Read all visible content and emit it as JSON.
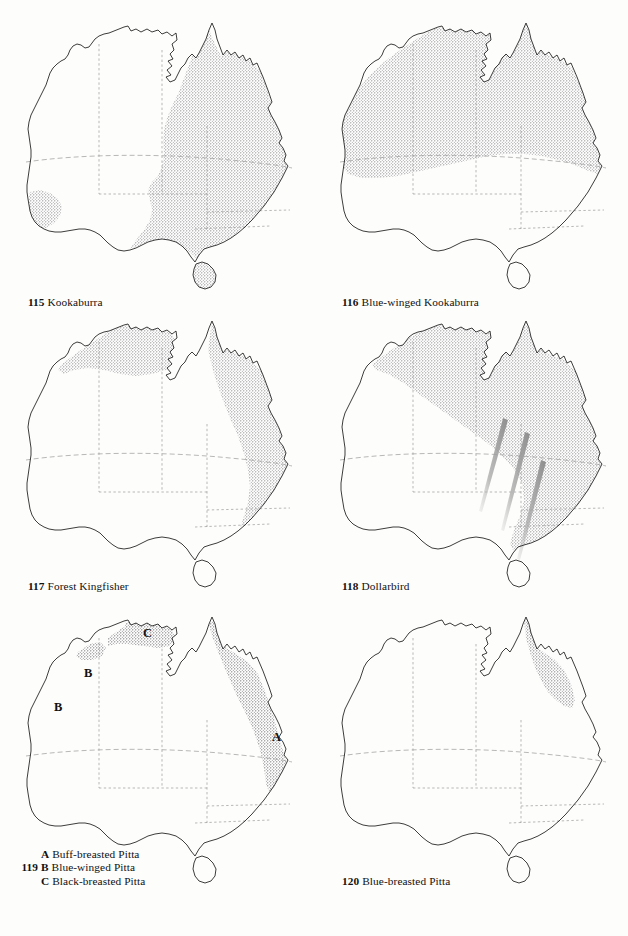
{
  "page": {
    "kind": "field-guide-distribution-map-plate",
    "background_color": "#fdfdfb",
    "ink_color": "#1a1a1a",
    "stipple_color": "#6b6b6b",
    "arrow_color": "#8e8e8e",
    "border_color": "#8a8a8a"
  },
  "maps": [
    {
      "id": "map-115",
      "number": "115",
      "name": "Kookaburra",
      "caption": "115 Kookaburra",
      "region_description": "Eastern Australia from Cape York south through Queensland, New South Wales, Victoria, eastern South Australia and Tasmania; introduced population in south-west Western Australia",
      "markers": []
    },
    {
      "id": "map-116",
      "number": "116",
      "name": "Blue-winged Kookaburra",
      "caption": "116 Blue-winged Kookaburra",
      "region_description": "Northern Australia across the Kimberley, Top End and Gulf country, extending down the Queensland coast to about the mid-east coast",
      "markers": []
    },
    {
      "id": "map-117",
      "number": "117",
      "name": "Forest Kingfisher",
      "caption": "117 Forest Kingfisher",
      "region_description": "Kimberley and Top End of northern Australia and along the east coast from Cape York to southern New South Wales",
      "markers": []
    },
    {
      "id": "map-118",
      "number": "118",
      "name": "Dollarbird",
      "caption": "118 Dollarbird",
      "region_description": "Northern and eastern Australia; migration routes shown as diagonal arrows across the south-east",
      "markers": [],
      "migration_arrows": 3
    },
    {
      "id": "map-119",
      "number": "119",
      "caption_lines": [
        {
          "lead": "",
          "letter": "A",
          "text": "Buff-breasted Pitta"
        },
        {
          "lead": "119",
          "letter": "B",
          "text": "Blue-winged Pitta"
        },
        {
          "lead": "",
          "letter": "C",
          "text": "Black-breasted Pitta"
        }
      ],
      "region_description": "Scattered ranges: north-west Kimberley coast and Top End, and the east coast from Cape York to northern New South Wales",
      "markers": [
        {
          "label": "A",
          "x": 277,
          "y": 130,
          "note": "east-coast range, Buff-breasted Pitta"
        },
        {
          "label": "B",
          "x": 88,
          "y": 66,
          "note": "north Kimberley coast, Blue-winged Pitta"
        },
        {
          "label": "B",
          "x": 58,
          "y": 100,
          "note": "west Kimberley coast, Blue-winged Pitta"
        },
        {
          "label": "C",
          "x": 147,
          "y": 26,
          "note": "Top End, Black-breasted Pitta"
        }
      ]
    },
    {
      "id": "map-120",
      "number": "120",
      "name": "Blue-breasted Pitta",
      "caption": "120 Blue-breasted Pitta",
      "region_description": "Restricted to Cape York Peninsula and the north-east Queensland coast",
      "markers": []
    }
  ]
}
